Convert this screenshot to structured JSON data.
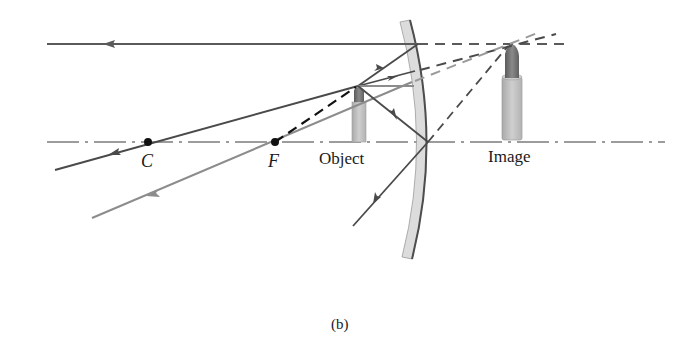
{
  "diagram": {
    "caption": "(b)",
    "mirror_type": "convex",
    "labels": {
      "center_of_curvature": "C",
      "focal_point": "F",
      "object": "Object",
      "image": "Image"
    },
    "points": {
      "C": {
        "x": 148,
        "y": 142
      },
      "F": {
        "x": 275,
        "y": 142
      }
    },
    "colors": {
      "dark_ray": "#4a4a4a",
      "gray_ray": "#8c8c8c",
      "black_dashed": "#111111",
      "mirror_fill": "#d9d9d9",
      "mirror_edge": "#555555",
      "axis": "#333333",
      "candle_body": "#bdbdbd",
      "candle_tip": "#6e6e6e",
      "background": "#ffffff"
    }
  }
}
